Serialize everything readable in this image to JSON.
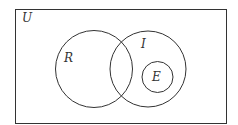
{
  "diagram": {
    "type": "venn",
    "universe": {
      "label": "U",
      "x": 15.5,
      "y": 9.5,
      "width": 211,
      "height": 114
    },
    "sets": [
      {
        "id": "R",
        "label": "R",
        "cx": 94,
        "cy": 69,
        "r": 38.5,
        "label_x": 68,
        "label_y": 62
      },
      {
        "id": "I",
        "label": "I",
        "cx": 148,
        "cy": 69,
        "r": 38,
        "label_x": 144,
        "label_y": 48
      },
      {
        "id": "E",
        "label": "E",
        "cx": 157.5,
        "cy": 77,
        "r": 15.5,
        "label_x": 157.5,
        "label_y": 81
      }
    ],
    "relations": [
      "R and I overlap",
      "E is a subset of I",
      "E does not intersect R"
    ],
    "colors": {
      "stroke": "#333333",
      "background": "#ffffff"
    }
  }
}
